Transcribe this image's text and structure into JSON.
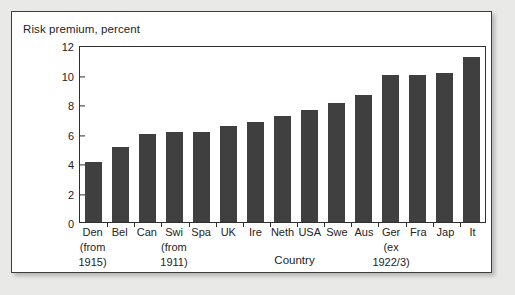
{
  "figure": {
    "title": "Risk premium, percent",
    "background_color": "#e9e9e7",
    "panel_color": "#ffffff",
    "border_color": "#3d3d3d",
    "bar_color": "#3b3b3b"
  },
  "chart_data": {
    "type": "bar",
    "title": "Risk premium, percent",
    "xlabel": "Country",
    "ylabel": "Risk premium, percent",
    "ylim": [
      0,
      12
    ],
    "yticks": [
      0,
      2,
      4,
      6,
      8,
      10,
      12
    ],
    "grid": false,
    "legend": null,
    "categories": [
      "Den",
      "Bel",
      "Can",
      "Swi",
      "Spa",
      "UK",
      "Ire",
      "Neth",
      "USA",
      "Swe",
      "Aus",
      "Ger",
      "Fra",
      "Jap",
      "It"
    ],
    "category_notes": [
      "(from 1915)",
      "",
      "",
      "(from 1911)",
      "",
      "",
      "",
      "",
      "",
      "",
      "",
      "(ex 1922/3)",
      "",
      "",
      ""
    ],
    "values": [
      4.1,
      5.1,
      6.0,
      6.1,
      6.1,
      6.5,
      6.8,
      7.2,
      7.6,
      8.1,
      8.6,
      10.0,
      10.0,
      10.1,
      11.2
    ]
  },
  "y_axis": {
    "ticks": [
      "0",
      "2",
      "4",
      "6",
      "8",
      "10",
      "12"
    ]
  },
  "x_axis": {
    "title": "Country",
    "labels": [
      "Den",
      "Bel",
      "Can",
      "Swi",
      "Spa",
      "UK",
      "Ire",
      "Neth",
      "USA",
      "Swe",
      "Aus",
      "Ger",
      "Fra",
      "Jap",
      "It"
    ],
    "notes": {
      "den_line1": "(from",
      "den_line2": "1915)",
      "swi_line1": "(from",
      "swi_line2": "1911)",
      "ger_line1": "(ex",
      "ger_line2": "1922/3)"
    }
  }
}
